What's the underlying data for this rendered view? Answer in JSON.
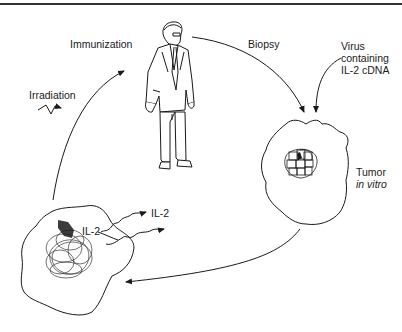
{
  "diagram": {
    "type": "cycle-illustration",
    "rule_color": "#333333",
    "stroke_color": "#1a1a1a",
    "nodes": {
      "patient": {
        "description": "Standing man in suit"
      },
      "tumor_in_vitro": {
        "label_line1": "Tumor",
        "label_line2": "in vitro"
      },
      "modified_tumor": {
        "secreted_label_inner": "IL-2",
        "secreted_label_outer": "IL-2"
      }
    },
    "edges": {
      "biopsy": {
        "label": "Biopsy"
      },
      "virus": {
        "label_line1": "Virus",
        "label_line2": "containing",
        "label_line3": "IL-2 cDNA"
      },
      "immunization": {
        "label": "Immunization"
      },
      "irradiation": {
        "label": "Irradiation"
      },
      "return": {
        "label": ""
      }
    }
  }
}
